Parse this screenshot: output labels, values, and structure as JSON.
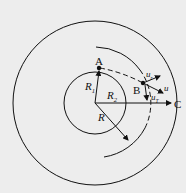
{
  "diagram": {
    "labels": {
      "A": "A",
      "B": "B",
      "C": "C",
      "R1": "R",
      "R1_sub": "1",
      "R2": "R",
      "R2_sub": "2",
      "R": "R",
      "u": "u",
      "ur": "u",
      "ur_sub": "r",
      "uT": "u",
      "uT_sub": "T"
    },
    "colors": {
      "ink": "#111111",
      "background": "#ededed"
    }
  }
}
